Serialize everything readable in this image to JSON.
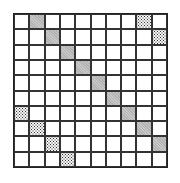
{
  "grid": {
    "rows": 10,
    "cols": 10,
    "grey_cells": [
      [
        0,
        1
      ],
      [
        1,
        2
      ],
      [
        2,
        3
      ],
      [
        3,
        4
      ],
      [
        4,
        5
      ],
      [
        5,
        6
      ],
      [
        6,
        7
      ],
      [
        7,
        8
      ],
      [
        8,
        9
      ]
    ],
    "dotted_cells": [
      [
        0,
        8
      ],
      [
        1,
        9
      ],
      [
        6,
        0
      ],
      [
        7,
        1
      ],
      [
        8,
        2
      ],
      [
        9,
        3
      ]
    ],
    "colors": {
      "line": "#333333",
      "grey": "#c9c9c9",
      "dotted": "#333333",
      "background": "#ffffff"
    }
  }
}
